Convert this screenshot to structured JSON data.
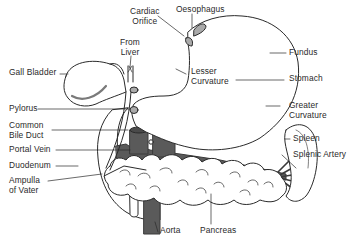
{
  "diagram": {
    "colors": {
      "line": "#2a2a2a",
      "vessel": "#5a5a5a",
      "organ_fill": "#ffffff",
      "background": "#ffffff"
    },
    "labels": {
      "cardiac_orifice": {
        "line1": "Cardiac",
        "line2": "Orifice"
      },
      "oesophagus": {
        "line1": "Oesophagus"
      },
      "from_liver": {
        "line1": "From",
        "line2": "Liver"
      },
      "fundus": {
        "line1": "Fundus"
      },
      "gall_bladder": {
        "line1": "Gall Bladder"
      },
      "lesser_curvature": {
        "line1": "Lesser",
        "line2": "Curvature"
      },
      "stomach": {
        "line1": "Stomach"
      },
      "pylorus": {
        "line1": "Pylorus"
      },
      "greater_curvature": {
        "line1": "Greater",
        "line2": "Curvature"
      },
      "common_bile_duct": {
        "line1": "Common",
        "line2": "Bile Duct"
      },
      "portal_vein": {
        "line1": "Portal Vein"
      },
      "spleen": {
        "line1": "Spleen"
      },
      "splenic_artery": {
        "line1": "Splenic Artery"
      },
      "duodenum": {
        "line1": "Duodenum"
      },
      "ampulla_of_vater": {
        "line1": "Ampulla",
        "line2": "of Vater"
      },
      "aorta": {
        "line1": "Aorta"
      },
      "pancreas": {
        "line1": "Pancreas"
      }
    }
  }
}
